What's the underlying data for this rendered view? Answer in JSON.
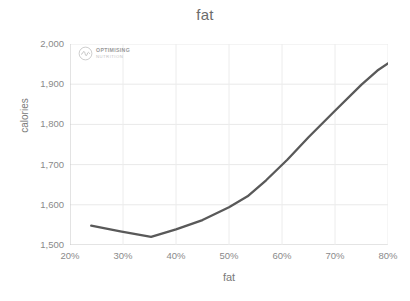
{
  "chart_data": {
    "type": "line",
    "title": "fat",
    "xlabel": "fat",
    "ylabel": "calories",
    "xlim": [
      20,
      80
    ],
    "ylim": [
      1500,
      2000
    ],
    "grid": true,
    "legend": "none",
    "line_color": "#595959",
    "x_tick_labels": [
      "20%",
      "30%",
      "40%",
      "50%",
      "60%",
      "70%",
      "80%"
    ],
    "x_ticks": [
      20,
      30,
      40,
      50,
      60,
      70,
      80
    ],
    "y_tick_labels": [
      "1,500",
      "1,600",
      "1,700",
      "1,800",
      "1,900",
      "2,000"
    ],
    "y_ticks": [
      1500,
      1600,
      1700,
      1800,
      1900,
      2000
    ],
    "series": [
      {
        "name": "calories",
        "x": [
          24.0,
          29.5,
          35.3,
          40.0,
          45.0,
          50.0,
          53.5,
          57.0,
          61.0,
          65.0,
          70.0,
          75.0,
          78.0,
          82.0
        ],
        "values": [
          1548,
          1534,
          1520,
          1539,
          1562,
          1594,
          1621,
          1661,
          1712,
          1768,
          1834,
          1899,
          1934,
          1970
        ]
      }
    ]
  },
  "watermark": {
    "primary": "OPTIMISING",
    "secondary": "NUTRITION"
  }
}
